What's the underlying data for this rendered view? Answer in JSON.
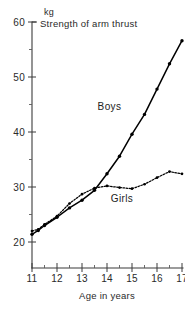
{
  "chart_data": {
    "type": "line",
    "title": "Strength of arm thrust",
    "xlabel": "Age in years",
    "ylabel": "kg",
    "xlim": [
      10.6,
      17.4
    ],
    "ylim": [
      16,
      60
    ],
    "grid": false,
    "legend_position": "inline-annotation",
    "xticks": [
      "11",
      "12",
      "13",
      "14",
      "15",
      "16",
      "17"
    ],
    "xtick_values": [
      11,
      12,
      13,
      14,
      15,
      16,
      17
    ],
    "yticks": [
      "20",
      "30",
      "40",
      "50",
      "60"
    ],
    "ytick_values": [
      20,
      30,
      40,
      50,
      60
    ],
    "yticks_minor": [
      25,
      35,
      45,
      55
    ],
    "series": [
      {
        "name": "Boys",
        "style": "solid",
        "x": [
          11.0,
          11.25,
          11.5,
          12.0,
          12.5,
          13.0,
          13.5,
          14.0,
          14.5,
          15.0,
          15.5,
          16.0,
          16.5,
          17.0
        ],
        "values": [
          21.4,
          22.1,
          23.0,
          24.5,
          26.2,
          27.6,
          29.4,
          32.4,
          35.6,
          39.6,
          43.2,
          47.8,
          52.4,
          56.6
        ]
      },
      {
        "name": "Girls",
        "style": "dotted",
        "x": [
          11.0,
          11.25,
          11.5,
          12.0,
          12.5,
          13.0,
          13.5,
          14.0,
          14.5,
          15.0,
          15.5,
          16.0,
          16.5,
          17.0
        ],
        "values": [
          22.0,
          22.3,
          23.2,
          24.7,
          27.0,
          28.7,
          29.8,
          30.2,
          29.9,
          29.7,
          30.5,
          31.7,
          32.8,
          32.4
        ]
      }
    ],
    "annotations": [
      {
        "text": "Boys",
        "x": 14.1,
        "y": 44.0
      },
      {
        "text": "Girls",
        "x": 14.6,
        "y": 27.2
      }
    ]
  }
}
